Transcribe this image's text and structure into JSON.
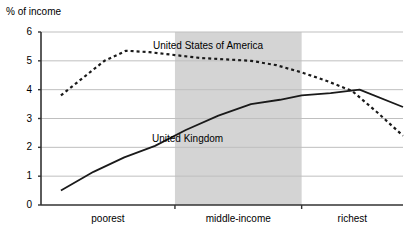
{
  "chart_data": {
    "type": "line",
    "title": "",
    "ylabel": "% of income",
    "xlabel": "",
    "ylim": [
      0,
      6
    ],
    "yticks": [
      "0",
      "1",
      "2",
      "3",
      "4",
      "5",
      "6"
    ],
    "grid": true,
    "legend_position": "inline-annotation",
    "xtick_labels": [
      "poorest",
      "middle-income",
      "richest"
    ],
    "x_band": {
      "label": "middle-income-shaded-band",
      "start_fraction": 0.37,
      "end_fraction": 0.72,
      "color": "#d4d4d4"
    },
    "series": [
      {
        "name": "United States of America",
        "style": "dashed",
        "color": "#1a1a1a",
        "x": [
          0.055,
          0.115,
          0.175,
          0.235,
          0.3,
          0.37,
          0.44,
          0.51,
          0.58,
          0.65,
          0.72,
          0.79,
          0.86,
          0.93,
          1.0
        ],
        "values": [
          3.8,
          4.4,
          5.0,
          5.35,
          5.3,
          5.2,
          5.1,
          5.05,
          5.0,
          4.85,
          4.6,
          4.3,
          3.95,
          3.2,
          2.4
        ]
      },
      {
        "name": "United Kingdom",
        "style": "solid",
        "color": "#1a1a1a",
        "x": [
          0.055,
          0.145,
          0.23,
          0.315,
          0.4,
          0.49,
          0.58,
          0.66,
          0.72,
          0.8,
          0.88,
          1.0
        ],
        "values": [
          0.5,
          1.15,
          1.65,
          2.05,
          2.6,
          3.1,
          3.5,
          3.65,
          3.8,
          3.88,
          4.0,
          3.4
        ]
      }
    ],
    "annotations": [
      {
        "name": "usa-label",
        "text": "United States of America",
        "x_px": 153,
        "y_px": 40
      },
      {
        "name": "uk-label",
        "text": "United Kingdom",
        "x_px": 152,
        "y_px": 133
      }
    ]
  }
}
